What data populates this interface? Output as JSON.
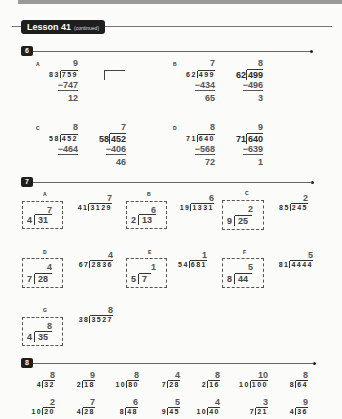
{
  "header": {
    "title": "Lesson 41",
    "subtitle": "(continued)"
  },
  "section6": {
    "number": "6",
    "problems": [
      {
        "label": "A",
        "work": {
          "quotient": "9",
          "divisor": "83",
          "dividend": "759",
          "subtract": "−747",
          "remainder": "12"
        }
      },
      {
        "label": "B",
        "work": {
          "quotient": "7",
          "divisor": "62",
          "dividend": "499",
          "subtract": "−434",
          "remainder": "65"
        },
        "answer": {
          "quotient": "8",
          "divisor": "62",
          "dividend": "499",
          "subtract": "−496",
          "remainder": "3"
        }
      },
      {
        "label": "C",
        "work": {
          "quotient": "8",
          "divisor": "58",
          "dividend": "452",
          "subtract": "−464"
        },
        "answer": {
          "quotient": "7",
          "divisor": "58",
          "dividend": "452",
          "subtract": "−406",
          "remainder": "46"
        }
      },
      {
        "label": "D",
        "work": {
          "quotient": "8",
          "divisor": "71",
          "dividend": "640",
          "subtract": "−568",
          "remainder": "72"
        },
        "answer": {
          "quotient": "9",
          "divisor": "71",
          "dividend": "640",
          "subtract": "−639",
          "remainder": "1"
        }
      }
    ]
  },
  "section7": {
    "number": "7",
    "problems": [
      {
        "label": "A",
        "box": {
          "quotient": "7",
          "divisor": "4",
          "dividend": "31"
        },
        "full": {
          "quotient": "7",
          "divisor": "41",
          "dividend": "3129"
        }
      },
      {
        "label": "B",
        "box": {
          "quotient": "6",
          "divisor": "2",
          "dividend": "13"
        },
        "full": {
          "quotient": "6",
          "divisor": "19",
          "dividend": "1331"
        }
      },
      {
        "label": "C",
        "box": {
          "quotient": "2",
          "divisor": "9",
          "dividend": "25"
        },
        "full": {
          "quotient": "2",
          "divisor": "85",
          "dividend": "245"
        }
      },
      {
        "label": "D",
        "box": {
          "quotient": "4",
          "divisor": "7",
          "dividend": "28"
        },
        "full": {
          "quotient": "4",
          "divisor": "67",
          "dividend": "2836"
        }
      },
      {
        "label": "E",
        "box": {
          "quotient": "1",
          "divisor": "5",
          "dividend": "7"
        },
        "full": {
          "quotient": "1",
          "divisor": "54",
          "dividend": "681"
        }
      },
      {
        "label": "F",
        "box": {
          "quotient": "5",
          "divisor": "8",
          "dividend": "44"
        },
        "full": {
          "quotient": "5",
          "divisor": "81",
          "dividend": "4444"
        }
      },
      {
        "label": "G",
        "box": {
          "quotient": "8",
          "divisor": "4",
          "dividend": "35"
        },
        "full": {
          "quotient": "8",
          "divisor": "38",
          "dividend": "3527"
        }
      }
    ]
  },
  "section8": {
    "number": "8",
    "rows": [
      [
        {
          "quotient": "8",
          "divisor": "4",
          "dividend": "32"
        },
        {
          "quotient": "9",
          "divisor": "2",
          "dividend": "18"
        },
        {
          "quotient": "8",
          "divisor": "10",
          "dividend": "80"
        },
        {
          "quotient": "4",
          "divisor": "7",
          "dividend": "28"
        },
        {
          "quotient": "8",
          "divisor": "2",
          "dividend": "16"
        },
        {
          "quotient": "10",
          "divisor": "10",
          "dividend": "100"
        },
        {
          "quotient": "8",
          "divisor": "8",
          "dividend": "64"
        }
      ],
      [
        {
          "quotient": "2",
          "divisor": "10",
          "dividend": "20"
        },
        {
          "quotient": "7",
          "divisor": "4",
          "dividend": "28"
        },
        {
          "quotient": "6",
          "divisor": "8",
          "dividend": "48"
        },
        {
          "quotient": "5",
          "divisor": "9",
          "dividend": "45"
        },
        {
          "quotient": "4",
          "divisor": "10",
          "dividend": "40"
        },
        {
          "quotient": "3",
          "divisor": "7",
          "dividend": "21"
        },
        {
          "quotient": "9",
          "divisor": "4",
          "dividend": "36"
        }
      ]
    ]
  }
}
